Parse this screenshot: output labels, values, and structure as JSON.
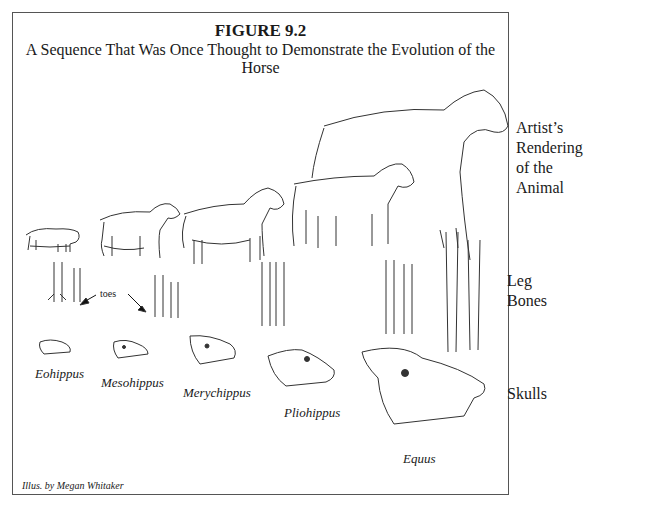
{
  "figure": {
    "number": "FIGURE 9.2",
    "title": "A Sequence That Was Once Thought to Demonstrate the Evolution of the Horse"
  },
  "row_labels": {
    "animal": [
      "Artist’s",
      "Rendering",
      "of the",
      "Animal"
    ],
    "legs": [
      "Leg",
      "Bones"
    ],
    "skulls": "Skulls"
  },
  "annotations": {
    "toes": "toes"
  },
  "species": [
    {
      "name": "Eohippus"
    },
    {
      "name": "Mesohippus"
    },
    {
      "name": "Merychippus"
    },
    {
      "name": "Pliohippus"
    },
    {
      "name": "Equus"
    }
  ],
  "credit": "Illus. by Megan Whitaker"
}
